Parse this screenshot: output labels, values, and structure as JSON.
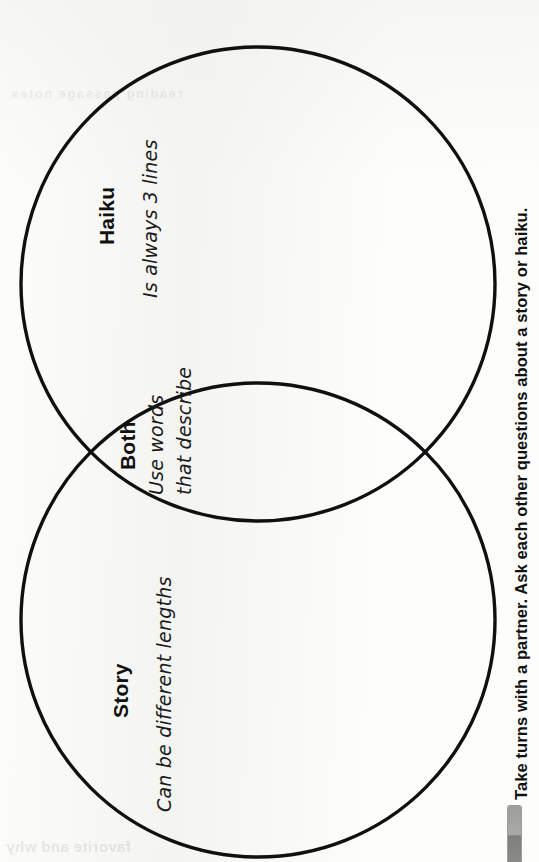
{
  "page": {
    "width": 539,
    "height": 862,
    "orientation": "rotated-90-ccw",
    "background_color": "#fdfdfc",
    "ink_color": "#111111"
  },
  "diagram": {
    "type": "venn-two-circle",
    "title_implicit": "Haiku and Story comparison",
    "stroke_color": "#101010",
    "stroke_width": 3.4,
    "circles": [
      {
        "name": "haiku-circle",
        "cx": 258,
        "cy": 284,
        "r": 237
      },
      {
        "name": "story-circle",
        "cx": 258,
        "cy": 620,
        "r": 237
      }
    ],
    "regions": [
      {
        "key": "haiku",
        "heading": "Haiku",
        "entries": [
          "Is always 3 lines"
        ]
      },
      {
        "key": "both",
        "heading": "Both",
        "entries": [
          "Use words",
          "that describe"
        ]
      },
      {
        "key": "story",
        "heading": "Story",
        "entries": [
          "Can be different lengths"
        ]
      }
    ]
  },
  "instruction": {
    "text": "Take turns with a partner. Ask each other questions about a story or haiku."
  },
  "artifacts": {
    "binding_bar_color": "#9d9d9a",
    "bleed_through_bottom": "favorite and why",
    "bleed_through_top": "reading passage notes"
  }
}
